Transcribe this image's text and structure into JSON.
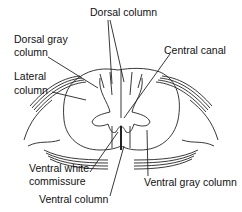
{
  "diagram": {
    "labels": {
      "dorsal_column": "Dorsal column",
      "dorsal_gray_column_1": "Dorsal gray",
      "dorsal_gray_column_2": "column",
      "lateral_column_1": "Lateral",
      "lateral_column_2": "column",
      "central_canal": "Central canal",
      "ventral_white_commissure_1": "Ventral white",
      "ventral_white_commissure_2": "commissure",
      "ventral_column": "Ventral column",
      "ventral_gray_column": "Ventral gray column"
    }
  }
}
